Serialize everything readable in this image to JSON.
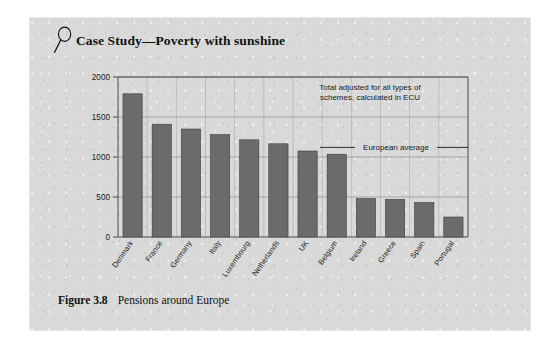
{
  "panel": {
    "heading": {
      "icon": "magnifier-icon",
      "title": "Case Study—Poverty with sunshine"
    },
    "caption": {
      "number": "Figure 3.8",
      "text": "Pensions around Europe"
    }
  },
  "colors": {
    "panel_background": "#d9d9d9",
    "bar_fill": "#6b6b6b",
    "bar_stroke": "#3d3d3d",
    "axis_line": "#4a4a4a",
    "grid_line": "#8f8f8f",
    "text": "#1a1a1a"
  },
  "chart_data": {
    "type": "bar",
    "title": "Pensions around Europe",
    "xlabel": "",
    "ylabel": "",
    "ylim": [
      0,
      2000
    ],
    "yticks": [
      0,
      500,
      1000,
      1500,
      2000
    ],
    "ytick_labels": [
      "0",
      "500",
      "1000",
      "1500",
      "2000"
    ],
    "grid": true,
    "legend_position": "none",
    "categories": [
      "Denmark",
      "France",
      "Germany",
      "Italy",
      "Luxembourg",
      "Netherlands",
      "UK",
      "Belgium",
      "Ireland",
      "Greece",
      "Spain",
      "Portugal"
    ],
    "values": [
      1790,
      1410,
      1350,
      1280,
      1215,
      1165,
      1075,
      1035,
      480,
      470,
      430,
      250
    ],
    "annotations": [
      {
        "name": "total-adjusted-note",
        "text_lines": [
          "Total adjusted for all types of",
          "schemes, calculated in ECU"
        ],
        "x": 0.72,
        "y": 1840
      },
      {
        "name": "european-average-line",
        "text": "European average",
        "value": 1120,
        "style": "horizontal-rule-with-label"
      }
    ]
  }
}
